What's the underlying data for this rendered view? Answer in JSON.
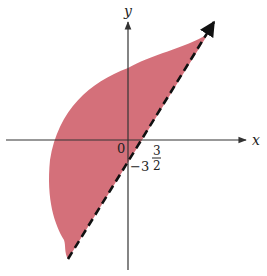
{
  "diagram": {
    "type": "shaded-region-graph",
    "axes": {
      "x_label": "x",
      "y_label": "y",
      "origin_label": "0"
    },
    "intercepts": {
      "x_intercept_label_num": "3",
      "x_intercept_label_den": "2",
      "y_intercept_label": "−3"
    },
    "boundary_line": {
      "style": "dashed",
      "description": "y = 2x − 3"
    },
    "colors": {
      "region_fill": "#D4707A",
      "axis": "#333333",
      "dashed_line": "#111111"
    }
  }
}
